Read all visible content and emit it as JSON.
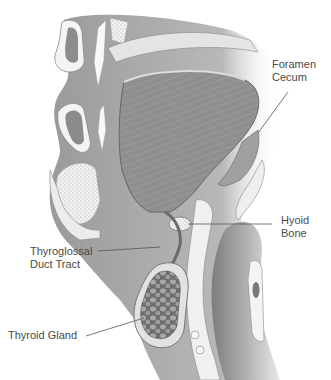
{
  "diagram": {
    "labels": {
      "foramen_cecum": {
        "line1": "Foramen",
        "line2": "Cecum"
      },
      "hyoid_bone": {
        "line1": "Hyoid",
        "line2": "Bone"
      },
      "thyroglossal_duct": {
        "line1": "Thyroglossal",
        "line2": "Duct Tract"
      },
      "thyroid_gland": {
        "line1": "Thyroid Gland"
      }
    },
    "colors": {
      "background": "#ffffff",
      "tissue_dark": "#8a8a8a",
      "tissue_mid": "#a9a9a9",
      "tissue_light": "#d4d4d4",
      "mucosa": "#ececec",
      "label_text": "#4a4a4a",
      "leader_line": "#555555"
    }
  }
}
